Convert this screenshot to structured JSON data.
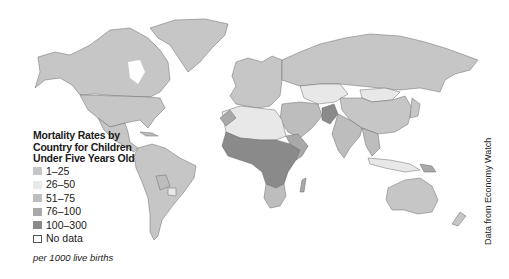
{
  "legend": {
    "title_lines": [
      "Mortality Rates by",
      "Country for Children",
      "Under Five Years Old"
    ],
    "items": [
      {
        "label": "1–25",
        "color": "#c6c6c6"
      },
      {
        "label": "26–50",
        "color": "#e8e8e8"
      },
      {
        "label": "51–75",
        "color": "#bdbdbd"
      },
      {
        "label": "76–100",
        "color": "#a9a9a9"
      },
      {
        "label": "100–300",
        "color": "#8a8a8a"
      },
      {
        "label": "No data",
        "color": "#ffffff"
      }
    ],
    "note": "per 1000 live births"
  },
  "source": "Data from Economy Watch",
  "colors": {
    "border": "#555555",
    "background": "#ffffff"
  }
}
